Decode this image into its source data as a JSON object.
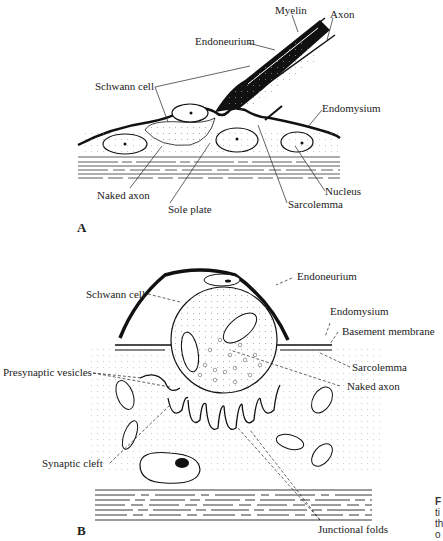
{
  "panels": [
    {
      "letter": "A",
      "labels": {
        "myelin": "Myelin",
        "axon": "Axon",
        "endoneurium": "Endoneurium",
        "schwann_cell": "Schwann cell",
        "endomysium": "Endomysium",
        "naked_axon": "Naked axon",
        "sole_plate": "Sole plate",
        "sarcolemma": "Sarcolemma",
        "nucleus": "Nucleus"
      }
    },
    {
      "letter": "B",
      "labels": {
        "endoneurium": "Endoneurium",
        "schwann_cell": "Schwann cell",
        "endomysium": "Endomysium",
        "basement_membrane": "Basement membrane",
        "sarcolemma": "Sarcolemma",
        "naked_axon": "Naked axon",
        "presynaptic_vesicles": "Presynaptic vesicles",
        "synaptic_cleft": "Synaptic cleft",
        "junctional_folds": "Junctional folds"
      }
    }
  ],
  "caption_fragment": [
    "F",
    "ti",
    "th",
    "o"
  ]
}
